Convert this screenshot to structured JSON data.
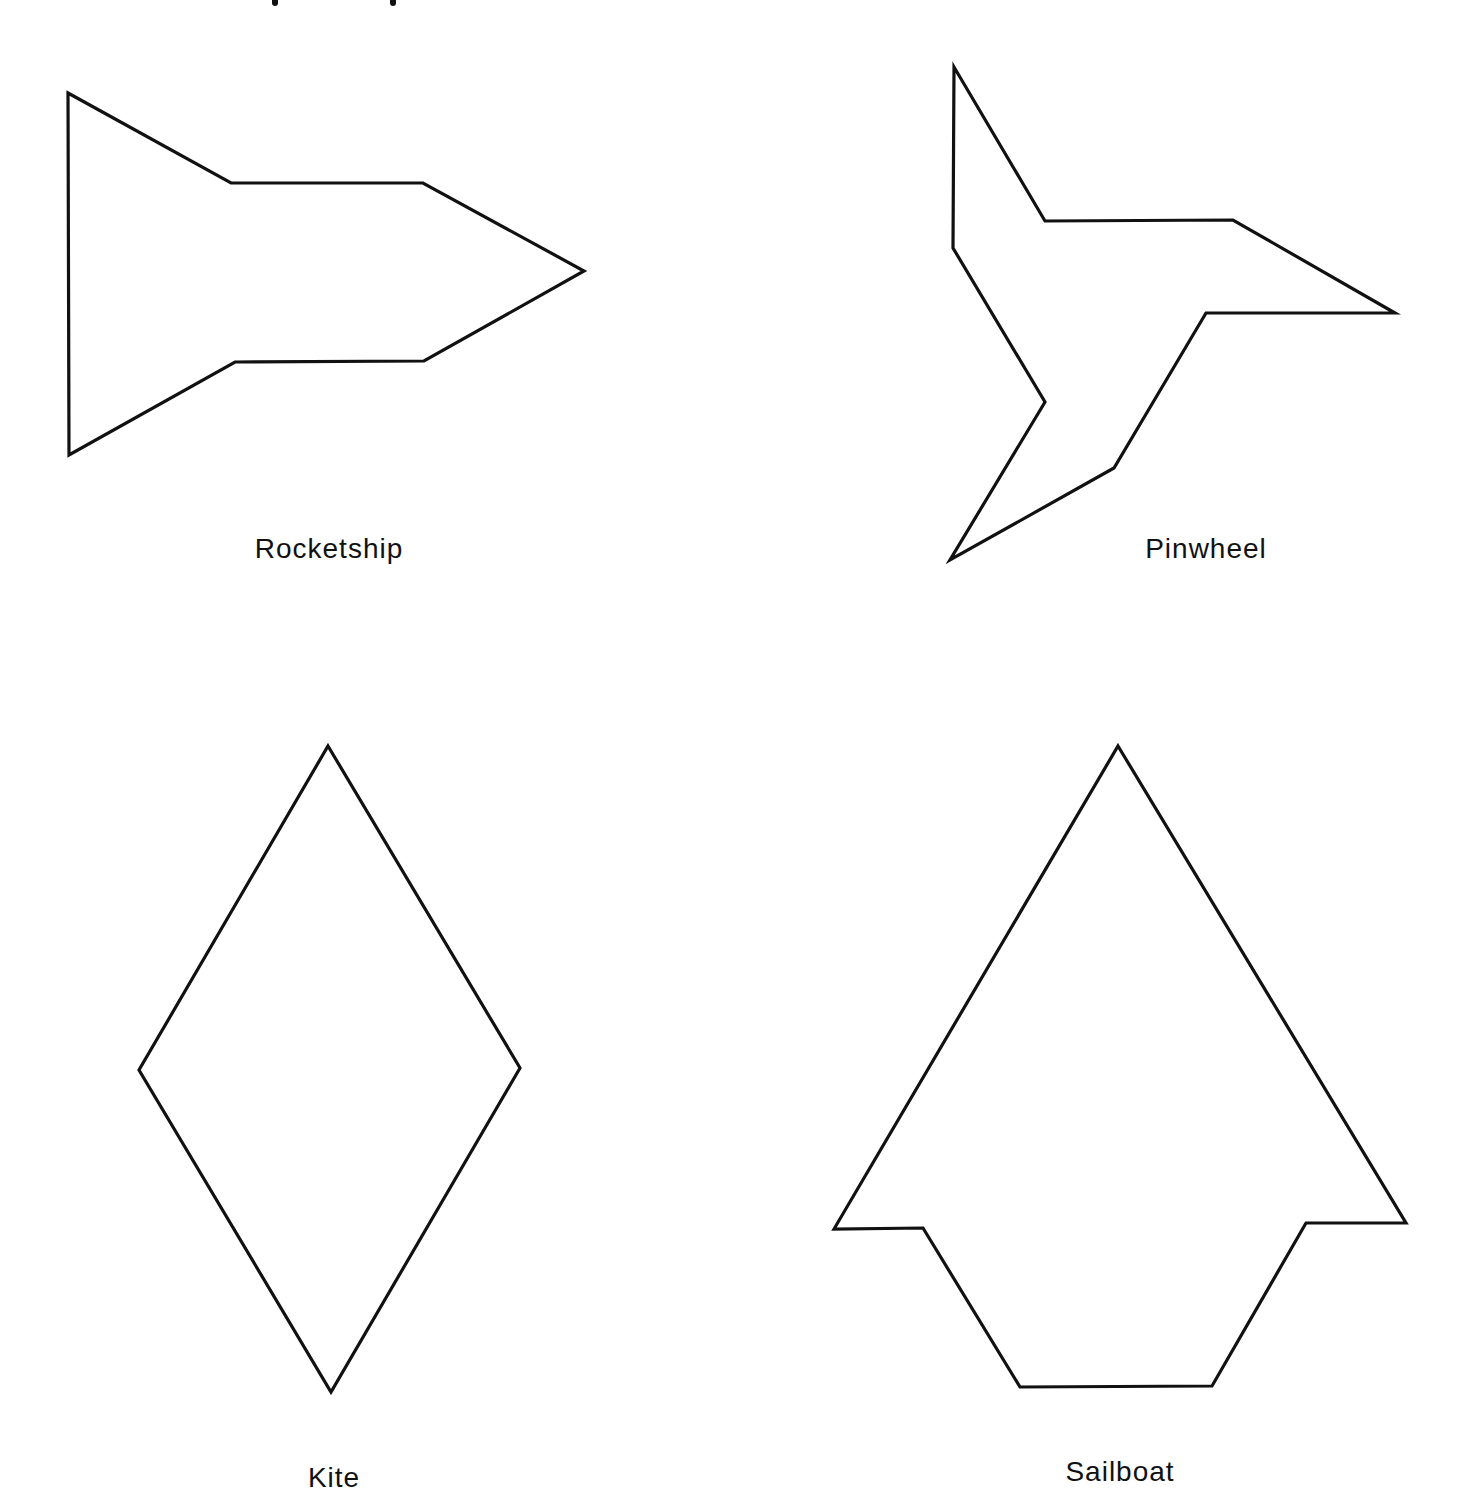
{
  "page": {
    "background": "#ffffff",
    "stroke_color": "#111111"
  },
  "shapes": [
    {
      "name": "Rocketship",
      "label": "Rocketship",
      "points": "68,93 231,183 423,183 584,271 424,361 235,362 69,455",
      "label_pos": {
        "x": 329,
        "y": 533
      }
    },
    {
      "name": "Pinwheel",
      "label": "Pinwheel",
      "points": "954,67 1045,221 1233,220 1395,313 1206,313 1114,468 950,560 1045,402 953,248",
      "label_pos": {
        "x": 1206,
        "y": 533
      }
    },
    {
      "name": "Kite",
      "label": "Kite",
      "points": "328,746 520,1068 331,1392 139,1070",
      "label_pos": {
        "x": 334,
        "y": 1462
      }
    },
    {
      "name": "Sailboat",
      "label": "Sailboat",
      "points": "1118,746 1406,1223 1306,1223 1212,1386 1020,1387 923,1228 834,1229",
      "label_pos": {
        "x": 1120,
        "y": 1456
      }
    }
  ]
}
